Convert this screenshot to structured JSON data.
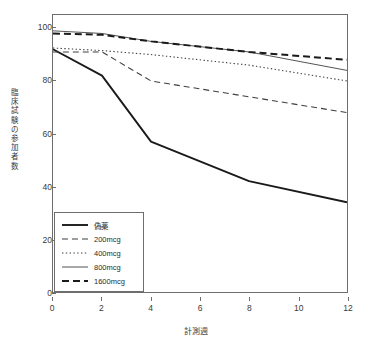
{
  "chart_data": {
    "type": "line",
    "title": "",
    "xlabel": "計測週",
    "ylabel": "臨床試験の参加者数",
    "ylabel_chars": [
      "臨",
      "床",
      "試",
      "験",
      "の",
      "参",
      "加",
      "者",
      "数"
    ],
    "x": [
      0,
      2,
      4,
      8,
      12
    ],
    "xlim": [
      0,
      12
    ],
    "ylim": [
      0,
      105
    ],
    "xticks": [
      0,
      2,
      4,
      6,
      8,
      10,
      12
    ],
    "yticks": [
      0,
      20,
      40,
      60,
      80,
      100
    ],
    "grid": false,
    "legend_position": "lower-left",
    "series": [
      {
        "name": "偽薬",
        "style": "solid",
        "width": 1.9,
        "color": "#1a1a1a",
        "values": [
          92,
          82,
          57,
          42,
          34
        ]
      },
      {
        "name": "200mcg",
        "style": "dashed",
        "width": 1.1,
        "color": "#3f3f3f",
        "values": [
          91,
          91,
          80,
          74,
          68
        ]
      },
      {
        "name": "400mcg",
        "style": "dotted",
        "width": 1.1,
        "color": "#3f3f3f",
        "values": [
          92.5,
          91.5,
          90,
          86,
          80
        ]
      },
      {
        "name": "800mcg",
        "style": "solid",
        "width": 0.9,
        "color": "#3f3f3f",
        "values": [
          99,
          98,
          95,
          91,
          84
        ]
      },
      {
        "name": "1600mcg",
        "style": "dashed",
        "width": 2.0,
        "color": "#1a1a1a",
        "values": [
          98,
          97.5,
          95,
          91,
          88
        ]
      }
    ]
  },
  "axis": {
    "x_tick_labels": [
      "0",
      "2",
      "4",
      "6",
      "8",
      "10",
      "12"
    ],
    "y_tick_labels": [
      "0",
      "20",
      "40",
      "60",
      "80",
      "100"
    ]
  },
  "legend": {
    "items": [
      {
        "label": "偽薬"
      },
      {
        "label": "200mcg"
      },
      {
        "label": "400mcg"
      },
      {
        "label": "800mcg"
      },
      {
        "label": "1600mcg"
      }
    ]
  },
  "colors": {
    "frame": "#6e6e6e",
    "text": "#3a3a3a",
    "line_dark": "#1a1a1a",
    "line_gray": "#3f3f3f",
    "background": "#ffffff"
  }
}
